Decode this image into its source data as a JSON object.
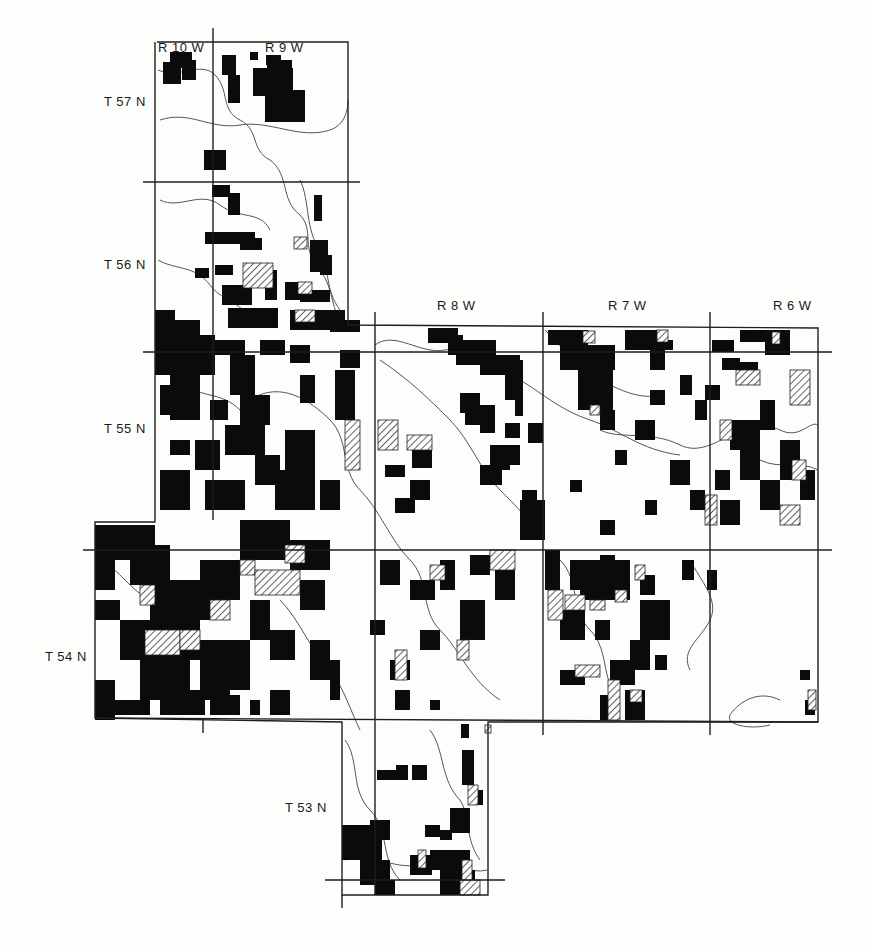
{
  "map": {
    "range_labels": [
      {
        "text": "R 10 W",
        "x": 158,
        "y": 47
      },
      {
        "text": "R 9 W",
        "x": 265,
        "y": 47
      },
      {
        "text": "R 8 W",
        "x": 437,
        "y": 306
      },
      {
        "text": "R 7 W",
        "x": 608,
        "y": 306
      },
      {
        "text": "R 6 W",
        "x": 773,
        "y": 306
      }
    ],
    "township_labels": [
      {
        "text": "T 57 N",
        "x": 104,
        "y": 100
      },
      {
        "text": "T 56 N",
        "x": 104,
        "y": 262
      },
      {
        "text": "T 55 N",
        "x": 104,
        "y": 427
      },
      {
        "text": "T 54 N",
        "x": 45,
        "y": 655
      },
      {
        "text": "T 53 N",
        "x": 285,
        "y": 806
      }
    ],
    "colors": {
      "ink": "#0b0b0b",
      "line": "#333333",
      "stream": "#555555",
      "hatch": "#222222",
      "paper": "#fdfdfc"
    },
    "legend": {
      "solid": "black parcels",
      "hatched": "hatched parcels"
    }
  }
}
